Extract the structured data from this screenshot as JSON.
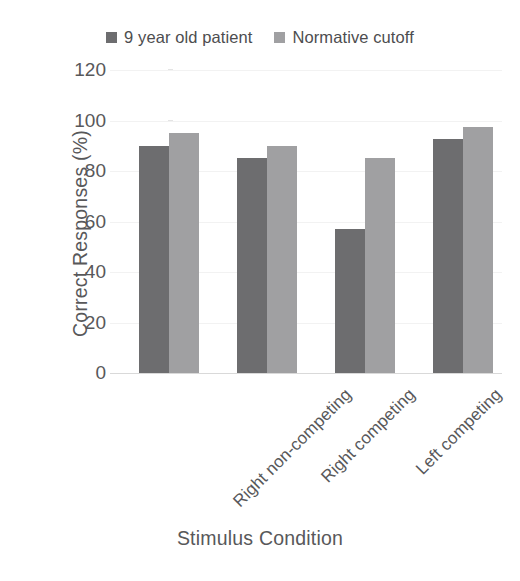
{
  "chart_data": {
    "type": "bar",
    "title": "",
    "xlabel": "Stimulus Condition",
    "ylabel": "Correct Responses (%)",
    "categories": [
      "Right non-competing",
      "Right competing",
      "Left competing",
      "Left non-competing"
    ],
    "series": [
      {
        "name": "9 year old patient",
        "color": "#6d6d6f",
        "values": [
          90,
          85,
          57,
          92.5
        ]
      },
      {
        "name": "Normative cutoff",
        "color": "#a0a0a2",
        "values": [
          95,
          90,
          85,
          97.5
        ]
      }
    ],
    "ylim": [
      0,
      120
    ],
    "ytick_values": [
      0,
      20,
      40,
      60,
      80,
      100,
      120
    ],
    "ytick_labels": [
      "0",
      "20",
      "40",
      "60",
      "80",
      "100",
      "120"
    ],
    "grid": true,
    "legend_position": "top-center",
    "x_tick_label_rotation": -45,
    "background_color": "#ffffff",
    "text_color": "#58585a",
    "gridline_color": "#f2f2f2",
    "axis_color": "#d9d9d9"
  }
}
